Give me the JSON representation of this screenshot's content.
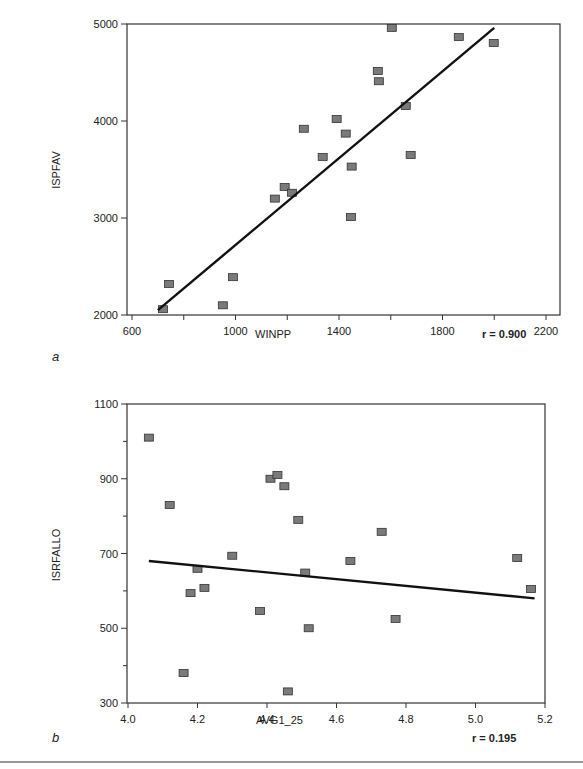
{
  "chart_data": [
    {
      "type": "scatter",
      "panel_label": "a",
      "title": "",
      "xlabel": "WINPP",
      "ylabel": "ISPFAV",
      "xlim": [
        600,
        2200
      ],
      "ylim": [
        2000,
        5000
      ],
      "x_ticks": [
        600,
        1000,
        1400,
        1800,
        2200
      ],
      "x_minor_ticks": [
        800,
        1200,
        1600,
        2000
      ],
      "y_ticks": [
        2000,
        3000,
        4000,
        5000
      ],
      "grid": false,
      "annotation": "r = 0.900",
      "points": [
        {
          "x": 720,
          "y": 2060
        },
        {
          "x": 743,
          "y": 2320
        },
        {
          "x": 951,
          "y": 2100
        },
        {
          "x": 990,
          "y": 2390
        },
        {
          "x": 1152,
          "y": 3200
        },
        {
          "x": 1190,
          "y": 3320
        },
        {
          "x": 1218,
          "y": 3260
        },
        {
          "x": 1264,
          "y": 3920
        },
        {
          "x": 1337,
          "y": 3630
        },
        {
          "x": 1391,
          "y": 4020
        },
        {
          "x": 1426,
          "y": 3870
        },
        {
          "x": 1446,
          "y": 3010
        },
        {
          "x": 1449,
          "y": 3530
        },
        {
          "x": 1550,
          "y": 4515
        },
        {
          "x": 1554,
          "y": 4410
        },
        {
          "x": 1604,
          "y": 4960
        },
        {
          "x": 1658,
          "y": 4155
        },
        {
          "x": 1677,
          "y": 3650
        },
        {
          "x": 1863,
          "y": 4865
        },
        {
          "x": 1998,
          "y": 4805
        }
      ],
      "fit_line": {
        "x": [
          700,
          2000
        ],
        "y": [
          2050,
          4960
        ]
      }
    },
    {
      "type": "scatter",
      "panel_label": "b",
      "title": "",
      "xlabel": "AVG1_25",
      "ylabel": "ISRFALLO",
      "xlim": [
        4.0,
        5.2
      ],
      "ylim": [
        300,
        1100
      ],
      "x_ticks": [
        4.0,
        4.2,
        4.4,
        4.6,
        4.8,
        5.0,
        5.2
      ],
      "y_ticks": [
        300,
        500,
        700,
        900,
        1100
      ],
      "y_minor_ticks": [
        400,
        600,
        800,
        1000
      ],
      "grid": false,
      "annotation": "r = 0.195",
      "points": [
        {
          "x": 4.06,
          "y": 1010
        },
        {
          "x": 4.12,
          "y": 830
        },
        {
          "x": 4.16,
          "y": 380
        },
        {
          "x": 4.18,
          "y": 594
        },
        {
          "x": 4.2,
          "y": 659
        },
        {
          "x": 4.22,
          "y": 608
        },
        {
          "x": 4.3,
          "y": 694
        },
        {
          "x": 4.38,
          "y": 546
        },
        {
          "x": 4.41,
          "y": 900
        },
        {
          "x": 4.43,
          "y": 910
        },
        {
          "x": 4.45,
          "y": 880
        },
        {
          "x": 4.46,
          "y": 331
        },
        {
          "x": 4.49,
          "y": 790
        },
        {
          "x": 4.51,
          "y": 649
        },
        {
          "x": 4.52,
          "y": 500
        },
        {
          "x": 4.64,
          "y": 680
        },
        {
          "x": 4.73,
          "y": 758
        },
        {
          "x": 4.77,
          "y": 525
        },
        {
          "x": 5.12,
          "y": 688
        },
        {
          "x": 5.16,
          "y": 605
        }
      ],
      "fit_line": {
        "x": [
          4.06,
          5.17
        ],
        "y": [
          680,
          580
        ]
      }
    }
  ],
  "style": {
    "marker_fill": "#7a7a7a",
    "marker_stroke": "#333333",
    "line_color": "#111111",
    "axis_color": "#333333"
  }
}
